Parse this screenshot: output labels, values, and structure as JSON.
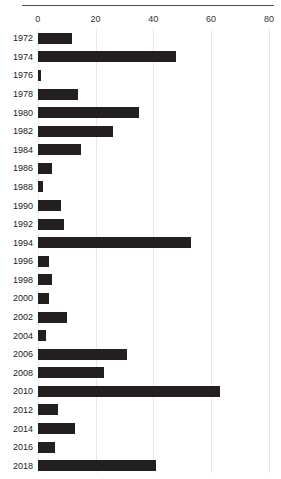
{
  "chart_data": {
    "type": "bar",
    "orientation": "horizontal",
    "title": "",
    "xlabel": "",
    "ylabel": "",
    "xlim": [
      0,
      80
    ],
    "xticks": [
      0,
      20,
      40,
      60,
      80
    ],
    "xticklabels": [
      "0",
      "20",
      "40",
      "60",
      "80"
    ],
    "grid": true,
    "legend": false,
    "bar_color": "#231f20",
    "grid_color": "#e8e8e8",
    "categories": [
      "1972",
      "1974",
      "1976",
      "1978",
      "1980",
      "1982",
      "1984",
      "1986",
      "1988",
      "1990",
      "1992",
      "1994",
      "1996",
      "1998",
      "2000",
      "2002",
      "2004",
      "2006",
      "2008",
      "2010",
      "2012",
      "2014",
      "2016",
      "2018"
    ],
    "values": [
      12,
      48,
      1,
      14,
      35,
      26,
      15,
      5,
      2,
      8,
      9,
      53,
      4,
      5,
      4,
      10,
      3,
      31,
      23,
      63,
      7,
      13,
      6,
      41
    ]
  },
  "axis": {
    "tick_0": "0",
    "tick_20": "20",
    "tick_40": "40",
    "tick_60": "60",
    "tick_80": "80"
  }
}
